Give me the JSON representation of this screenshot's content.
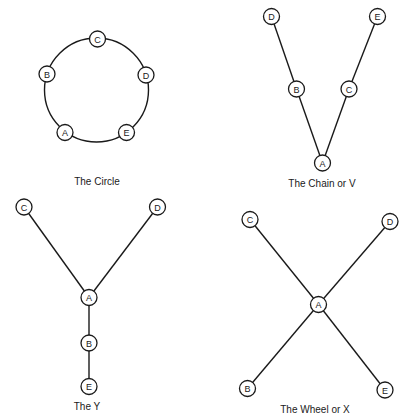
{
  "style": {
    "ink_color": "#1a1a1a",
    "background": "#ffffff",
    "node_radius": 8
  },
  "diagrams": [
    {
      "id": "circle",
      "caption": "The Circle",
      "caption_pos": [
        97,
        181
      ],
      "ring": {
        "cx": 96.5,
        "cy": 90,
        "r": 52
      },
      "nodes": [
        {
          "label": "C",
          "x": 97.5,
          "y": 39
        },
        {
          "label": "B",
          "x": 47,
          "y": 74
        },
        {
          "label": "D",
          "x": 146,
          "y": 75
        },
        {
          "label": "A",
          "x": 65,
          "y": 132.5
        },
        {
          "label": "E",
          "x": 126.5,
          "y": 132.5
        }
      ],
      "edges": []
    },
    {
      "id": "chain",
      "caption": "The Chain or V",
      "caption_pos": [
        322,
        183
      ],
      "nodes": [
        {
          "label": "D",
          "x": 271.5,
          "y": 16.5
        },
        {
          "label": "E",
          "x": 377.5,
          "y": 16.5
        },
        {
          "label": "B",
          "x": 296.5,
          "y": 89
        },
        {
          "label": "C",
          "x": 349,
          "y": 89
        },
        {
          "label": "A",
          "x": 322.5,
          "y": 163
        }
      ],
      "edges": [
        [
          "D",
          "B"
        ],
        [
          "B",
          "A"
        ],
        [
          "E",
          "C"
        ],
        [
          "C",
          "A"
        ]
      ]
    },
    {
      "id": "y",
      "caption": "The Y",
      "caption_pos": [
        87,
        406
      ],
      "nodes": [
        {
          "label": "C",
          "x": 24,
          "y": 207
        },
        {
          "label": "D",
          "x": 157.5,
          "y": 207
        },
        {
          "label": "A",
          "x": 89,
          "y": 297.5
        },
        {
          "label": "B",
          "x": 89,
          "y": 343
        },
        {
          "label": "E",
          "x": 89,
          "y": 386.5
        }
      ],
      "edges": [
        [
          "C",
          "A"
        ],
        [
          "D",
          "A"
        ],
        [
          "A",
          "B"
        ],
        [
          "B",
          "E"
        ]
      ]
    },
    {
      "id": "wheel",
      "caption": "The Wheel or X",
      "caption_pos": [
        315,
        409
      ],
      "nodes": [
        {
          "label": "C",
          "x": 250,
          "y": 219.5
        },
        {
          "label": "D",
          "x": 390,
          "y": 221.5
        },
        {
          "label": "A",
          "x": 318.5,
          "y": 304.5
        },
        {
          "label": "B",
          "x": 247.5,
          "y": 388.5
        },
        {
          "label": "E",
          "x": 385,
          "y": 390
        }
      ],
      "edges": [
        [
          "C",
          "A"
        ],
        [
          "D",
          "A"
        ],
        [
          "A",
          "B"
        ],
        [
          "A",
          "E"
        ]
      ]
    }
  ]
}
